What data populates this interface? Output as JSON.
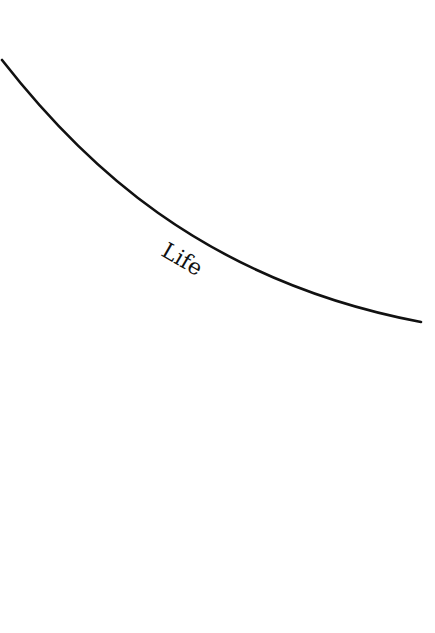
{
  "diagram": {
    "curve": {
      "label": "Life",
      "color": "#111111",
      "start": [
        2,
        60
      ],
      "end": [
        421,
        322
      ]
    },
    "background": "#ffffff"
  }
}
